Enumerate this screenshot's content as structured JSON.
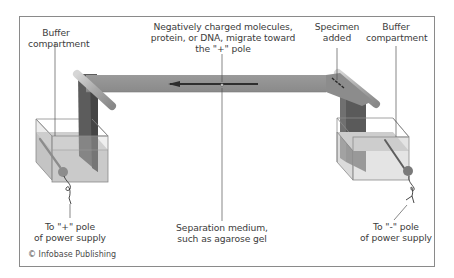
{
  "diagram": {
    "labels": {
      "buffer_left": [
        "Buffer",
        "compartment"
      ],
      "migration": [
        "Negatively charged molecules,",
        "protein, or DNA, migrate toward",
        "the \"+\" pole"
      ],
      "specimen": [
        "Specimen",
        "added"
      ],
      "buffer_right": [
        "Buffer",
        "compartment"
      ],
      "plus_pole": [
        "To \"+\" pole",
        "of power supply"
      ],
      "separation": [
        "Separation medium,",
        "such as agarose gel"
      ],
      "minus_pole": [
        "To \"-\" pole",
        "of power supply"
      ]
    },
    "credit": "© Infobase Publishing",
    "arrow_direction": "left",
    "colors": {
      "frame": "#8a8a8a",
      "gel": "#8f8f8f",
      "gel_dark": "#6e6e6e",
      "rod": "#a8a8a8",
      "buffer_liquid": "#c9c9c9",
      "box_edge": "#7a7a7a",
      "arrow": "#2e2e2e",
      "text": "#3c3c3c"
    }
  }
}
